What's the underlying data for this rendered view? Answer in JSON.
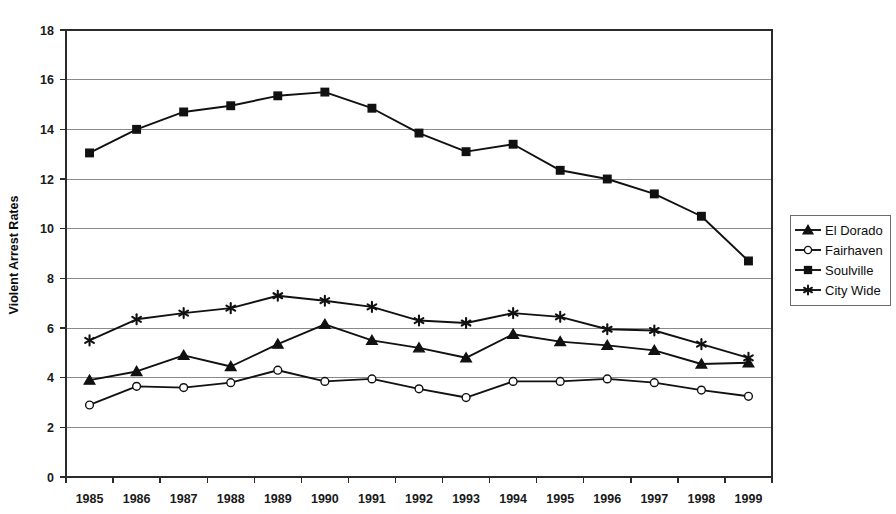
{
  "chart_data": {
    "type": "line",
    "title": "",
    "xlabel": "",
    "ylabel": "Violent Arrest Rates",
    "categories": [
      "1985",
      "1986",
      "1987",
      "1988",
      "1989",
      "1990",
      "1991",
      "1992",
      "1993",
      "1994",
      "1995",
      "1996",
      "1997",
      "1998",
      "1999"
    ],
    "x": [
      1985,
      1986,
      1987,
      1988,
      1989,
      1990,
      1991,
      1992,
      1993,
      1994,
      1995,
      1996,
      1997,
      1998,
      1999
    ],
    "ylim": [
      0,
      18
    ],
    "yticks": [
      0,
      2,
      4,
      6,
      8,
      10,
      12,
      14,
      16,
      18
    ],
    "ytick_labels": [
      "0",
      "2",
      "4",
      "6",
      "8",
      "10",
      "12",
      "14",
      "16",
      "18"
    ],
    "grid": true,
    "grid_axis": "y",
    "legend_position": "right",
    "series": [
      {
        "name": "El Dorado",
        "marker": "triangle",
        "marker_fill": "filled",
        "values": [
          3.9,
          4.25,
          4.9,
          4.45,
          5.35,
          6.15,
          5.5,
          5.2,
          4.8,
          5.75,
          5.45,
          5.3,
          5.1,
          4.55,
          4.6
        ]
      },
      {
        "name": "Fairhaven",
        "marker": "circle",
        "marker_fill": "hollow",
        "values": [
          2.9,
          3.65,
          3.6,
          3.8,
          4.3,
          3.85,
          3.95,
          3.55,
          3.2,
          3.85,
          3.85,
          3.95,
          3.8,
          3.5,
          3.25
        ]
      },
      {
        "name": "Soulville",
        "marker": "square",
        "marker_fill": "filled",
        "values": [
          13.05,
          14.0,
          14.7,
          14.95,
          15.35,
          15.5,
          14.85,
          13.85,
          13.1,
          13.4,
          12.35,
          12.0,
          11.4,
          10.5,
          8.7
        ]
      },
      {
        "name": "City Wide",
        "marker": "asterisk",
        "marker_fill": "filled",
        "values": [
          5.5,
          6.35,
          6.6,
          6.8,
          7.3,
          7.1,
          6.85,
          6.3,
          6.2,
          6.6,
          6.45,
          5.95,
          5.9,
          5.35,
          4.8
        ]
      }
    ]
  },
  "legend": {
    "entries": [
      {
        "label": "El Dorado"
      },
      {
        "label": "Fairhaven"
      },
      {
        "label": "Soulville"
      },
      {
        "label": "City Wide"
      }
    ]
  },
  "axes": {
    "y_title": "Violent Arrest Rates"
  }
}
